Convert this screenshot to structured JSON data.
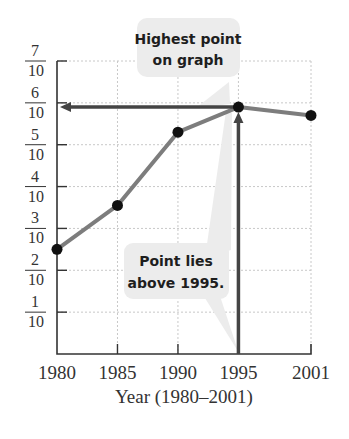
{
  "chart_data": {
    "type": "line",
    "title": "",
    "xlabel": "Year (1980–2001)",
    "ylabel": "",
    "categories": [
      "1980",
      "1985",
      "1990",
      "1995",
      "2001"
    ],
    "x": [
      1980,
      1985,
      1990,
      1995,
      2001
    ],
    "values": [
      0.25,
      0.355,
      0.53,
      0.59,
      0.57
    ],
    "series": [
      {
        "name": "data",
        "values": [
          0.25,
          0.355,
          0.53,
          0.59,
          0.57
        ]
      }
    ],
    "ylim": [
      0,
      0.7
    ],
    "y_ticks": [
      {
        "num": "1",
        "den": "10",
        "value": 0.1
      },
      {
        "num": "2",
        "den": "10",
        "value": 0.2
      },
      {
        "num": "3",
        "den": "10",
        "value": 0.3
      },
      {
        "num": "4",
        "den": "10",
        "value": 0.4
      },
      {
        "num": "5",
        "den": "10",
        "value": 0.5
      },
      {
        "num": "6",
        "den": "10",
        "value": 0.6
      },
      {
        "num": "7",
        "den": "10",
        "value": 0.7
      }
    ],
    "x_ticks": [
      "1980",
      "1985",
      "1990",
      "1995",
      "2001"
    ],
    "grid": true,
    "legend": "none",
    "annotations": [
      {
        "text_lines": [
          "Highest point",
          "on graph"
        ],
        "target": "1995"
      },
      {
        "text_lines": [
          "Point lies",
          "above 1995."
        ],
        "target": "1995"
      }
    ],
    "highlight": {
      "x": 1995,
      "y": 0.59,
      "arrows": [
        "vertical from x-axis at 1995 up to point",
        "horizontal from point left to y-axis"
      ]
    }
  },
  "colors": {
    "line": "#7d7d7d",
    "point": "#111111",
    "arrow": "#444444",
    "axis": "#333333",
    "grid": "#c8c8c8",
    "callout_bg": "#ececec"
  }
}
